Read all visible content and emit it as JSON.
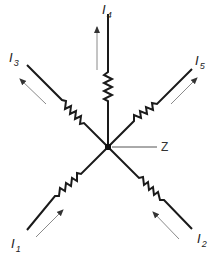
{
  "diagram": {
    "type": "current junction (Kirchhoff's current law)",
    "node": {
      "label": "Z"
    },
    "branches": [
      {
        "id": "I1",
        "symbol": "I",
        "subscript": "1",
        "direction": "into node"
      },
      {
        "id": "I2",
        "symbol": "I",
        "subscript": "2",
        "direction": "into node"
      },
      {
        "id": "I3",
        "symbol": "I",
        "subscript": "3",
        "direction": "out of node"
      },
      {
        "id": "I4",
        "symbol": "I",
        "subscript": "4",
        "direction": "out of node"
      },
      {
        "id": "I5",
        "symbol": "I",
        "subscript": "5",
        "direction": "out of node"
      }
    ]
  },
  "colors": {
    "wire": "#1a1a1a",
    "arrow": "#8a8a8a",
    "text": "#222222"
  }
}
